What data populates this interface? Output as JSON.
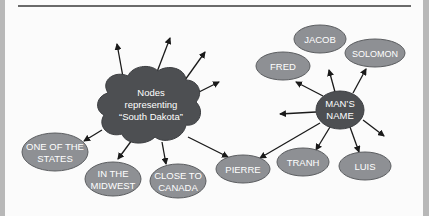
{
  "diagram": {
    "hub_south_dakota": {
      "lines": [
        "Nodes",
        "representing",
        "“South Dakota”"
      ],
      "color": "#4d4f52"
    },
    "hub_mans_name": {
      "lines": [
        "MAN’S",
        "NAME"
      ],
      "color": "#4d4f52"
    },
    "south_dakota_nodes": [
      {
        "lines": [
          "ONE OF THE",
          "STATES"
        ]
      },
      {
        "lines": [
          "IN THE",
          "MIDWEST"
        ]
      },
      {
        "lines": [
          "CLOSE TO",
          "CANADA"
        ]
      }
    ],
    "shared_node": {
      "lines": [
        "PIERRE"
      ]
    },
    "mans_name_nodes": [
      {
        "lines": [
          "FRED"
        ]
      },
      {
        "lines": [
          "JACOB"
        ]
      },
      {
        "lines": [
          "SOLOMON"
        ]
      },
      {
        "lines": [
          "TRANH"
        ]
      },
      {
        "lines": [
          "LUIS"
        ]
      }
    ],
    "node_color": "#8e9094",
    "node_border": "#5c5e61",
    "arrow_color": "#1a1a1a"
  }
}
